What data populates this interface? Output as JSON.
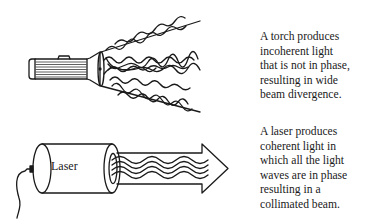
{
  "torch_panel": {
    "caption_lines": [
      "A torch produces",
      "incoherent light",
      "that is not in phase,",
      "resulting in wide",
      "beam divergence."
    ]
  },
  "laser_panel": {
    "device_label": "Laser",
    "caption_lines": [
      "A laser produces",
      "coherent light in",
      "which all the light",
      "waves are in phase",
      "resulting in a",
      "collimated beam."
    ]
  }
}
